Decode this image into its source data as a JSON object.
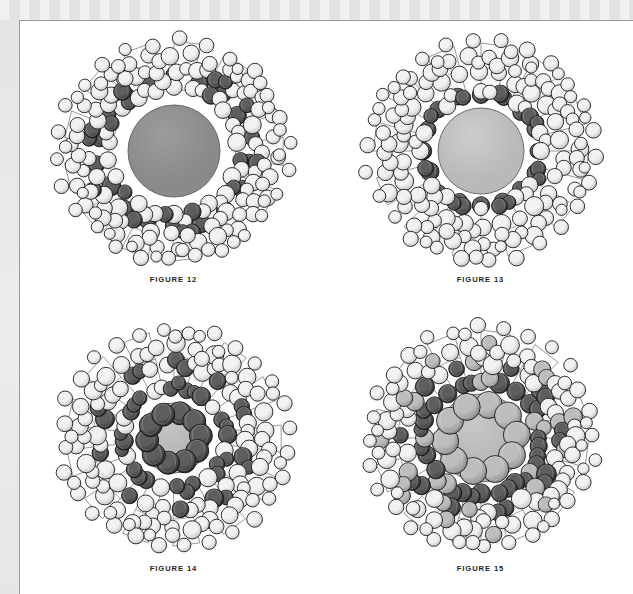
{
  "page": {
    "background_color": "#e9e9e9",
    "sheet_color": "#ffffff",
    "border_color": "#9a9a9a"
  },
  "figures": [
    {
      "id": "figure-12",
      "caption": "FIGURE 12",
      "core": {
        "radius": 46,
        "color": "#8a8a8a",
        "highlight": "#9c9c9c"
      },
      "core_ring": {
        "count": 0,
        "radius": 0,
        "sphere_radius": 0,
        "color": "#555555"
      },
      "shells": [
        {
          "name": "inner-shell",
          "count": 22,
          "orbit": 66,
          "sphere_radius": 8.2,
          "phase": 0,
          "palette": [
            "light",
            "light",
            "dark",
            "light",
            "light",
            "light",
            "dark",
            "light"
          ]
        },
        {
          "name": "mid-shell",
          "count": 26,
          "orbit": 84,
          "sphere_radius": 8.0,
          "phase": 0.12,
          "palette": [
            "light",
            "dark",
            "light",
            "light",
            "dark",
            "light",
            "light",
            "light"
          ]
        },
        {
          "name": "outer-shell",
          "count": 30,
          "orbit": 101,
          "sphere_radius": 7.8,
          "phase": 0.06,
          "palette": [
            "light",
            "light",
            "light",
            "light",
            "light",
            "light",
            "light",
            "light"
          ]
        },
        {
          "name": "rim-shell",
          "count": 26,
          "orbit": 114,
          "sphere_radius": 6.8,
          "phase": 0.2,
          "palette": [
            "light",
            "light",
            "light",
            "light",
            "light",
            "light",
            "light",
            "light"
          ]
        }
      ],
      "cage": {
        "spokes": 13,
        "inner_radius": 62,
        "outer_radius": 110,
        "color": "#8d8d8d"
      },
      "dark_band": {
        "orbit": 76,
        "count": 18,
        "sphere_radius": 8.6,
        "color": "#3b3b3b"
      }
    },
    {
      "id": "figure-13",
      "caption": "FIGURE 13",
      "core": {
        "radius": 43,
        "color": "#b9b9b9",
        "highlight": "#cdcdcd"
      },
      "core_ring": {
        "count": 0,
        "radius": 0,
        "sphere_radius": 0,
        "color": "#555555"
      },
      "shells": [
        {
          "name": "inner-shell",
          "count": 20,
          "orbit": 60,
          "sphere_radius": 8.0,
          "phase": 0.05,
          "palette": [
            "dark",
            "light",
            "dark",
            "light",
            "light",
            "dark",
            "light",
            "light"
          ]
        },
        {
          "name": "mid-shell",
          "count": 26,
          "orbit": 80,
          "sphere_radius": 8.4,
          "phase": 0.15,
          "palette": [
            "light",
            "light",
            "light",
            "light",
            "light",
            "light",
            "light",
            "light"
          ]
        },
        {
          "name": "outer-shell",
          "count": 30,
          "orbit": 99,
          "sphere_radius": 8.0,
          "phase": 0.08,
          "palette": [
            "light",
            "light",
            "light",
            "light",
            "light",
            "light",
            "light",
            "light"
          ]
        },
        {
          "name": "rim-shell",
          "count": 26,
          "orbit": 113,
          "sphere_radius": 7.0,
          "phase": 0.22,
          "palette": [
            "light",
            "light",
            "light",
            "light",
            "light",
            "light",
            "light",
            "light"
          ]
        }
      ],
      "cage": {
        "spokes": 12,
        "inner_radius": 58,
        "outer_radius": 108,
        "color": "#8d8d8d"
      },
      "dark_band": {
        "orbit": 58,
        "count": 16,
        "sphere_radius": 8.2,
        "color": "#3b3b3b"
      }
    },
    {
      "id": "figure-14",
      "caption": "FIGURE 14",
      "core": {
        "radius": 35,
        "color": "#b2b2b2",
        "highlight": "#c6c6c6"
      },
      "core_ring": {
        "count": 10,
        "radius": 27,
        "sphere_radius": 11.5,
        "color": "#4a4a4a"
      },
      "shells": [
        {
          "name": "inner-shell",
          "count": 20,
          "orbit": 52,
          "sphere_radius": 8.2,
          "phase": 0.04,
          "palette": [
            "dark",
            "dark",
            "light",
            "dark",
            "dark",
            "light",
            "dark",
            "light"
          ]
        },
        {
          "name": "mid-shell",
          "count": 26,
          "orbit": 74,
          "sphere_radius": 8.4,
          "phase": 0.14,
          "palette": [
            "light",
            "dark",
            "light",
            "light",
            "dark",
            "light",
            "light",
            "dark"
          ]
        },
        {
          "name": "outer-shell",
          "count": 30,
          "orbit": 95,
          "sphere_radius": 8.2,
          "phase": 0.07,
          "palette": [
            "light",
            "light",
            "light",
            "light",
            "light",
            "light",
            "light",
            "light"
          ]
        },
        {
          "name": "rim-shell",
          "count": 28,
          "orbit": 112,
          "sphere_radius": 7.2,
          "phase": 0.2,
          "palette": [
            "light",
            "light",
            "light",
            "light",
            "light",
            "light",
            "light",
            "light"
          ]
        }
      ],
      "cage": {
        "spokes": 13,
        "inner_radius": 54,
        "outer_radius": 108,
        "color": "#8d8d8d"
      },
      "dark_band": {
        "orbit": 0,
        "count": 0,
        "sphere_radius": 0,
        "color": "#3b3b3b"
      }
    },
    {
      "id": "figure-15",
      "caption": "FIGURE 15",
      "core": {
        "radius": 44,
        "color": "#b5b5b5",
        "highlight": "#c8c8c8"
      },
      "core_ring": {
        "count": 10,
        "radius": 36,
        "sphere_radius": 13.5,
        "color": "#7d7d7d"
      },
      "shells": [
        {
          "name": "inner-shell",
          "count": 20,
          "orbit": 58,
          "sphere_radius": 9.0,
          "phase": 0.05,
          "palette": [
            "dark",
            "dark",
            "dark",
            "mid",
            "dark",
            "dark",
            "mid",
            "dark"
          ]
        },
        {
          "name": "mid-shell",
          "count": 26,
          "orbit": 78,
          "sphere_radius": 8.8,
          "phase": 0.14,
          "palette": [
            "dark",
            "light",
            "mid",
            "dark",
            "light",
            "dark",
            "mid",
            "light"
          ]
        },
        {
          "name": "outer-shell",
          "count": 30,
          "orbit": 97,
          "sphere_radius": 8.4,
          "phase": 0.08,
          "palette": [
            "light",
            "mid",
            "light",
            "light",
            "mid",
            "light",
            "light",
            "light"
          ]
        },
        {
          "name": "rim-shell",
          "count": 28,
          "orbit": 113,
          "sphere_radius": 7.2,
          "phase": 0.21,
          "palette": [
            "light",
            "light",
            "light",
            "light",
            "light",
            "light",
            "light",
            "light"
          ]
        }
      ],
      "cage": {
        "spokes": 12,
        "inner_radius": 58,
        "outer_radius": 108,
        "color": "#8d8d8d"
      },
      "dark_band": {
        "orbit": 0,
        "count": 0,
        "sphere_radius": 0,
        "color": "#3b3b3b"
      }
    }
  ],
  "sphere_palette": {
    "light": {
      "fill": "#f2f2f2",
      "shade": "#c9c9c9",
      "stroke": "#1a1a1a"
    },
    "mid": {
      "fill": "#bdbdbd",
      "shade": "#8a8a8a",
      "stroke": "#1a1a1a"
    },
    "dark": {
      "fill": "#5e5e5e",
      "shade": "#2c2c2c",
      "stroke": "#101010"
    }
  }
}
